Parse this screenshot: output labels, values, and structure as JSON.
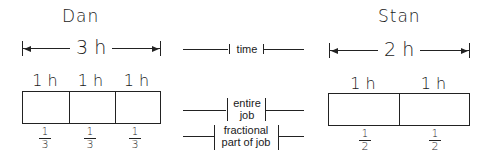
{
  "dan": {
    "name": "Dan",
    "total_time": "3 h",
    "segments": [
      {
        "time": "1 h",
        "fraction_num": "1",
        "fraction_den": "3"
      },
      {
        "time": "1 h",
        "fraction_num": "1",
        "fraction_den": "3"
      },
      {
        "time": "1 h",
        "fraction_num": "1",
        "fraction_den": "3"
      }
    ]
  },
  "stan": {
    "name": "Stan",
    "total_time": "2 h",
    "segments": [
      {
        "time": "1 h",
        "fraction_num": "1",
        "fraction_den": "2"
      },
      {
        "time": "1 h",
        "fraction_num": "1",
        "fraction_den": "2"
      }
    ]
  },
  "legend": {
    "time": "time",
    "entire_job_line1": "entire",
    "entire_job_line2": "job",
    "fraction_line1": "fractional",
    "fraction_line2": "part of job"
  }
}
